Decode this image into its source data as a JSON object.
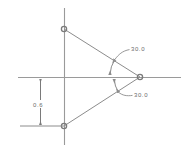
{
  "drawing": {
    "title": "Isosceles triangle angular dimension drawing",
    "background_color": "#ffffff",
    "line_color": "#8c8c8c",
    "axis_color": "#9a9a9a",
    "text_color": "#6b6b6b",
    "vertex_marker_color": "#7a7a7a"
  },
  "axes": {
    "horizontal_label": "horizontal-axis",
    "vertical_label": "vertical-axis",
    "horizontal": {
      "x1": 18,
      "y1": 77,
      "x2": 181,
      "y2": 77
    },
    "vertical": {
      "x1": 64,
      "y1": 8,
      "x2": 64,
      "y2": 145
    }
  },
  "geometry": {
    "vertices": [
      {
        "name": "top-left-vertex",
        "x": 64,
        "y": 29
      },
      {
        "name": "right-vertex",
        "x": 140,
        "y": 77
      },
      {
        "name": "bottom-left-vertex",
        "x": 64,
        "y": 126
      }
    ],
    "edges": [
      {
        "name": "upper-edge",
        "x1": 64,
        "y1": 29,
        "x2": 140,
        "y2": 77
      },
      {
        "name": "lower-edge",
        "x1": 64,
        "y1": 126,
        "x2": 140,
        "y2": 77
      },
      {
        "name": "base-edge",
        "x1": 64,
        "y1": 29,
        "x2": 64,
        "y2": 126
      }
    ]
  },
  "dimensions": {
    "angle_upper": {
      "value": "30.0",
      "units": "degrees",
      "label_x": 131,
      "label_y": 51,
      "arc": {
        "cx": 140,
        "cy": 77,
        "r": 36,
        "start_deg": 180,
        "end_deg": 147.7
      },
      "leader": {
        "x1": 122,
        "y1": 48,
        "x2": 130,
        "y2": 50
      }
    },
    "angle_lower": {
      "value": "30.0",
      "units": "degrees",
      "label_x": 134,
      "label_y": 96,
      "arc": {
        "cx": 140,
        "cy": 77,
        "r": 30,
        "start_deg": 180,
        "end_deg": 212.8
      },
      "leader": {
        "x1": 124,
        "y1": 94,
        "x2": 133,
        "y2": 94
      }
    },
    "linear_vertical": {
      "value": "0.6",
      "units": "",
      "label_x": 34,
      "label_y": 106,
      "dim_line": {
        "x": 40,
        "y1": 80,
        "y2": 124
      },
      "extension_top": {
        "x1": 20,
        "y1": 77,
        "x2": 64,
        "y2": 77
      },
      "extension_bottom": {
        "x1": 20,
        "y1": 126,
        "x2": 64,
        "y2": 126
      }
    }
  }
}
